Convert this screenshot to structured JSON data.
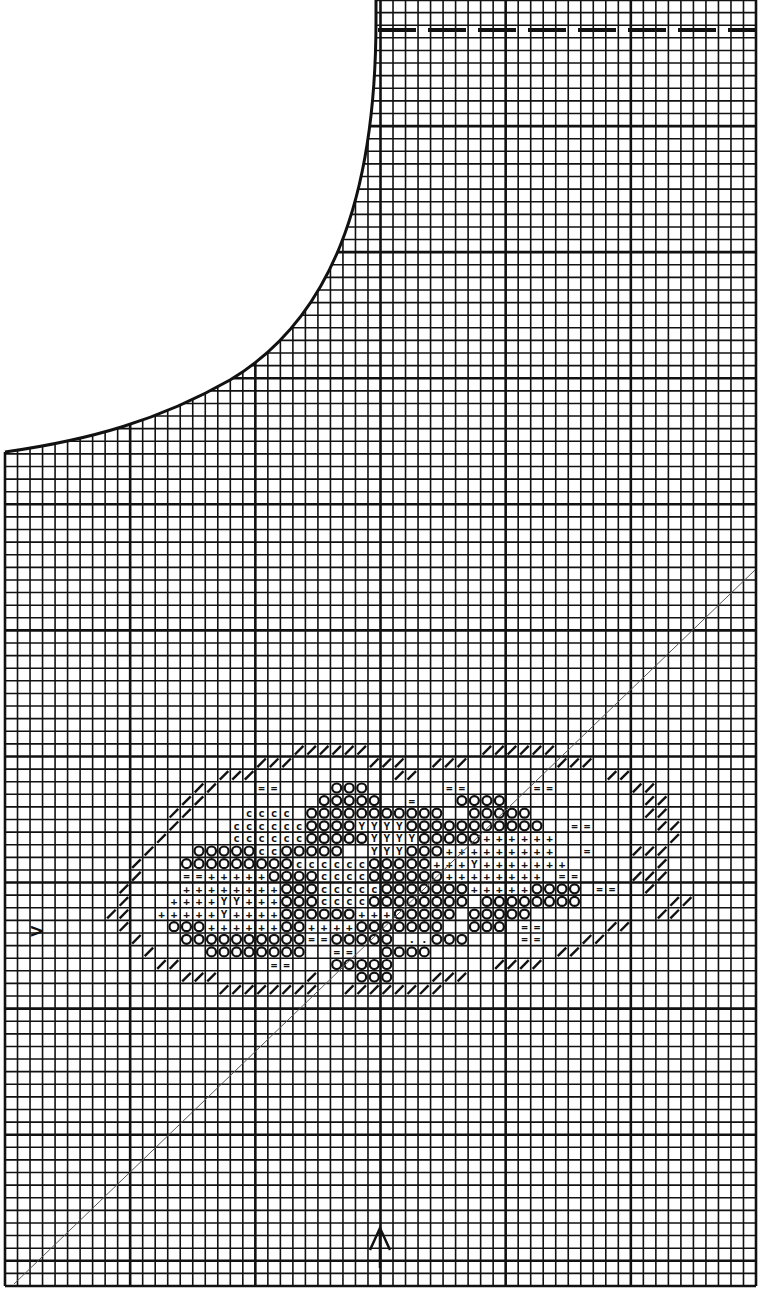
{
  "chart": {
    "title": "",
    "kind": "cross-stitch pattern chart",
    "grid": {
      "columns": 60,
      "rows": 102,
      "major_every": 10
    },
    "ink_color": "#111111",
    "paper_color": "#ffffff",
    "legend": [
      {
        "symbol": "o",
        "meaning": "filled circle stitch"
      },
      {
        "symbol": "c",
        "meaning": "c-stitch"
      },
      {
        "symbol": "+",
        "meaning": "cross stitch"
      },
      {
        "symbol": "Y",
        "meaning": "Y stitch"
      },
      {
        "symbol": "=",
        "meaning": "double-bar stitch"
      },
      {
        "symbol": "/",
        "meaning": "half stitch (outline)"
      },
      {
        "symbol": ".",
        "meaning": "dot stitch"
      }
    ],
    "markers": {
      "center_left": ">",
      "center_bottom": "^"
    },
    "notes": {
      "dashed_line": "fold line near top right",
      "curve": "neckline / armhole curve top-left",
      "diagonal": "thin diagonal guideline bottom-left to right"
    }
  },
  "pattern_rows": [
    "                                                            ",
    "                  //////         //////                     ",
    "               ///      ///  ///       ///                  ",
    "            ///           //               //               ",
    "          //   ==    ooo      ==     ==      //             ",
    "         //         ooooo  =   oooo           //            ",
    "        //    cccc ooooooooooo  ooooo         //            ",
    "        /    ccccccooooYYYYooooooooooo  ==     //           ",
    "       /     ccccccoooooYYYYooooo++++++         /           ",
    "      /   oooooccooooo  YYYooo+++++++++  =   ///           ",
    "     /   oooooooooccccccooooo+++Y+++++++       /           ",
    "     /   ==+++++ooooccccoooooo++++++++ ==    ///           ",
    "    /    ++++++++ooocccccooooooo+++++oooo ==  /            ",
    "    /   ++++YY+++oooccccoooooooo oooooooo       //          ",
    "   //  +++++Y++++oooooo+++ooooo ooooo          //           ",
    "    /   ooo++++++oo++++ooooooo  ooo ==     //               ",
    "     /   oooooooooo==ooooo ..ooo    ==   //                 ",
    "      /    oooooooo  ==  oooo          //                   ",
    "       //       ==   ooooo        ////                      ",
    "         ///       /   ooo   ///                            ",
    "            ////////  ////////                               "
  ],
  "pattern_origin": {
    "col": 5,
    "row": 58
  }
}
